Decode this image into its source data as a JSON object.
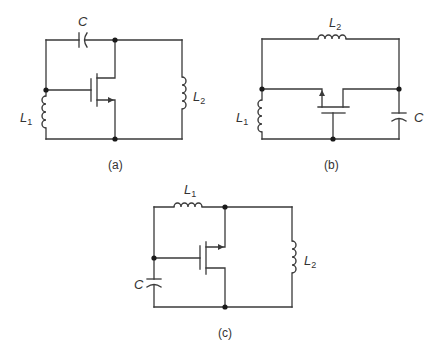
{
  "circuits": [
    {
      "id": "a",
      "caption": "(a)",
      "labels": {
        "capacitor": "C",
        "inductor1": "L",
        "inductor1_sub": "1",
        "inductor2": "L",
        "inductor2_sub": "2"
      }
    },
    {
      "id": "b",
      "caption": "(b)",
      "labels": {
        "capacitor": "C",
        "inductor1": "L",
        "inductor1_sub": "1",
        "inductor2": "L",
        "inductor2_sub": "2"
      }
    },
    {
      "id": "c",
      "caption": "(c)",
      "labels": {
        "capacitor": "C",
        "inductor1": "L",
        "inductor1_sub": "1",
        "inductor2": "L",
        "inductor2_sub": "2"
      }
    }
  ]
}
